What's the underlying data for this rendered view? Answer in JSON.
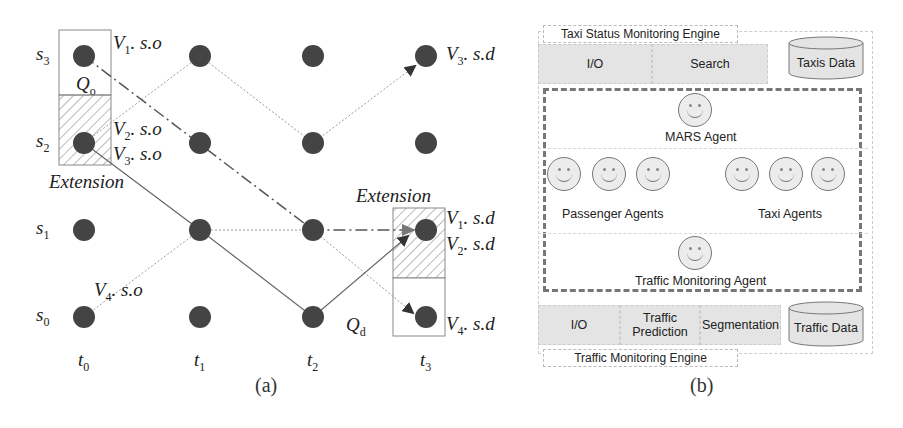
{
  "panel_a": {
    "caption": "(a)",
    "rows": [
      "s",
      "s",
      "s",
      "s"
    ],
    "row_subs": [
      "3",
      "2",
      "1",
      "0"
    ],
    "cols": [
      "t",
      "t",
      "t",
      "t"
    ],
    "col_subs": [
      "0",
      "1",
      "2",
      "3"
    ],
    "labels": {
      "v1_so": {
        "v": "V",
        "sub": "1",
        "rest": ". s.o"
      },
      "v2_so": {
        "v": "V",
        "sub": "2",
        "rest": ". s.o"
      },
      "v3_so": {
        "v": "V",
        "sub": "3",
        "rest": ". s.o"
      },
      "v4_so": {
        "v": "V",
        "sub": "4",
        "rest": ". s.o"
      },
      "v1_sd": {
        "v": "V",
        "sub": "1",
        "rest": ". s.d"
      },
      "v2_sd": {
        "v": "V",
        "sub": "2",
        "rest": ". s.d"
      },
      "v3_sd": {
        "v": "V",
        "sub": "3",
        "rest": ". s.d"
      },
      "v4_sd": {
        "v": "V",
        "sub": "4",
        "rest": ". s.d"
      },
      "qo": {
        "q": "Q",
        "sub": "o"
      },
      "qd": {
        "q": "Q",
        "sub": "d"
      },
      "ext_left": "Extension",
      "ext_right": "Extension"
    },
    "colors": {
      "node": "#444444",
      "solid": "#666666",
      "dotted": "#999999",
      "dashdot": "#555555"
    }
  },
  "panel_b": {
    "caption": "(b)",
    "top_engine": {
      "title": "Taxi Status Monitoring Engine",
      "blocks": [
        "I/O",
        "Search"
      ],
      "store": "Taxis Data"
    },
    "agents": {
      "mars": "MARS Agent",
      "passenger": "Passenger Agents",
      "taxi": "Taxi Agents",
      "traffic": "Traffic Monitoring Agent"
    },
    "bottom_engine": {
      "title": "Traffic Monitoring Engine",
      "blocks": [
        "I/O",
        "Traffic Prediction",
        "Segmentation"
      ],
      "store": "Traffic Data"
    }
  }
}
